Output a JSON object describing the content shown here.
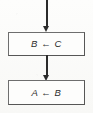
{
  "diagram": {
    "type": "flowchart",
    "background_color": "#fbfbfa",
    "stroke_color": "#2b2b2b",
    "box_border_color": "#565656",
    "text_color": "#2e2e2e",
    "nodes": [
      {
        "id": "box-bc",
        "shape": "rectangle",
        "role": "process",
        "label": "B ← C",
        "target": "B",
        "source": "C",
        "operator": "←"
      },
      {
        "id": "box-ab",
        "shape": "rectangle",
        "role": "process",
        "label": "A ← B",
        "target": "A",
        "source": "B",
        "operator": "←"
      }
    ],
    "connectors": [
      {
        "id": "arrow-top",
        "from": "entry-point",
        "to": "box-bc",
        "direction": "down",
        "arrowhead": "filled-triangle"
      },
      {
        "id": "arrow-mid",
        "from": "box-bc",
        "to": "box-ab",
        "direction": "down",
        "arrowhead": "filled-triangle"
      }
    ]
  }
}
